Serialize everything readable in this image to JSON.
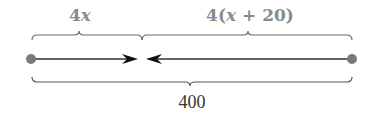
{
  "diagram": {
    "segments": [
      {
        "id": "left",
        "label_prefix": "4",
        "label_var": "x",
        "label_suffix": ""
      },
      {
        "id": "right",
        "label_prefix": "4(",
        "label_var": "x",
        "label_suffix": " + 20)"
      }
    ],
    "total": {
      "label": "400"
    },
    "points": [
      {
        "id": "left-endpoint",
        "x": 31,
        "y": 59
      },
      {
        "id": "right-endpoint",
        "x": 352,
        "y": 59
      }
    ],
    "colors": {
      "line": "#333333",
      "dot": "#7a7a7a",
      "brace": "#666666",
      "top_label": "#8a8a8a",
      "bottom_label": "#333333"
    }
  }
}
